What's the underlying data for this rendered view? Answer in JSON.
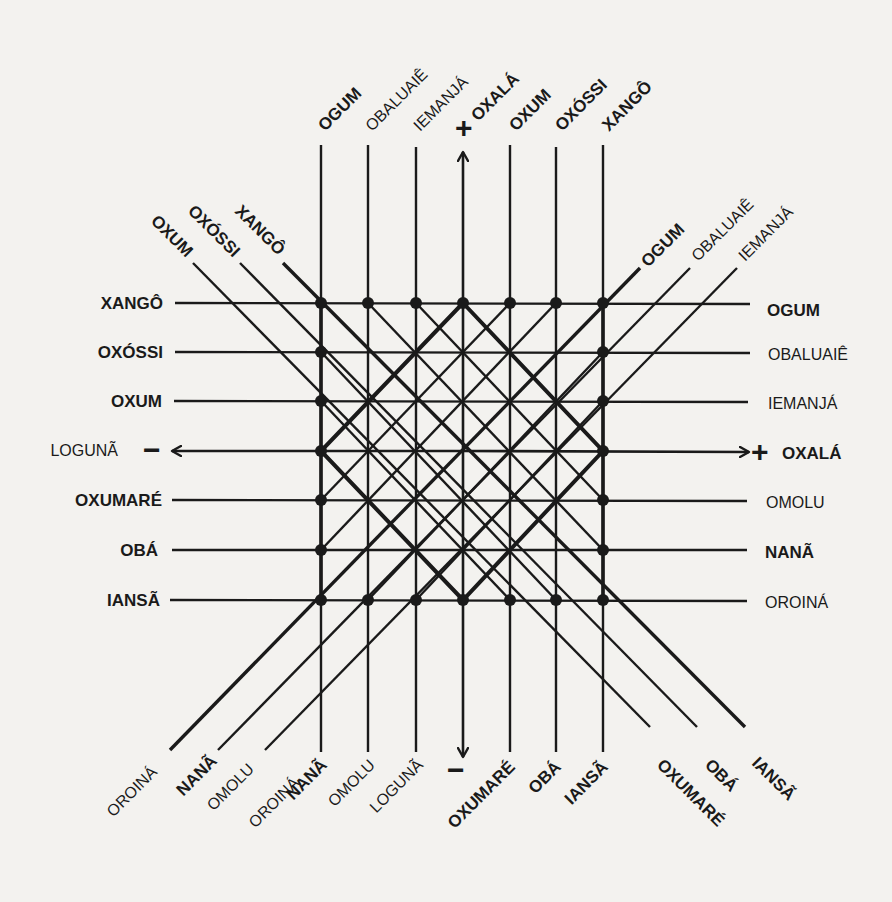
{
  "diagram": {
    "title": "",
    "ink_color": "#1a1a1a",
    "paper_color": "#f3f2ef",
    "grid": {
      "x": [
        321,
        368,
        416,
        463,
        510,
        556,
        603
      ],
      "y": [
        303,
        352,
        401,
        451,
        500,
        550,
        600
      ]
    },
    "top_labels": [
      {
        "text": "OGUM",
        "bold": true
      },
      {
        "text": "OBALUAIÊ",
        "bold": false
      },
      {
        "text": "IEMANJÁ",
        "bold": false
      },
      {
        "text": "OXALÁ",
        "bold": true,
        "sign": "+"
      },
      {
        "text": "OXUM",
        "bold": true
      },
      {
        "text": "OXÓSSI",
        "bold": true
      },
      {
        "text": "XANGÔ",
        "bold": true
      }
    ],
    "bottom_labels": [
      {
        "text": "NANÃ",
        "bold": true
      },
      {
        "text": "OMOLU",
        "bold": false
      },
      {
        "text": "LOGUNÃ",
        "bold": false
      },
      {
        "text": "",
        "bold": false,
        "sign": "−"
      },
      {
        "text": "OXUMARÉ",
        "bold": true
      },
      {
        "text": "OBÁ",
        "bold": true
      },
      {
        "text": "IANSÃ",
        "bold": true
      }
    ],
    "left_labels": [
      {
        "text": "XANGÔ",
        "bold": true
      },
      {
        "text": "OXÓSSI",
        "bold": true
      },
      {
        "text": "OXUM",
        "bold": true
      },
      {
        "text": "LOGUNÃ",
        "bold": false,
        "sign": "−"
      },
      {
        "text": "OXUMARÉ",
        "bold": true
      },
      {
        "text": "OBÁ",
        "bold": true
      },
      {
        "text": "IANSÃ",
        "bold": true
      }
    ],
    "right_labels": [
      {
        "text": "OGUM",
        "bold": true
      },
      {
        "text": "OBALUAIÊ",
        "bold": false
      },
      {
        "text": "IEMANJÁ",
        "bold": false
      },
      {
        "text": "OXALÁ",
        "bold": true,
        "sign": "+"
      },
      {
        "text": "OMOLU",
        "bold": false
      },
      {
        "text": "NANÃ",
        "bold": true
      },
      {
        "text": "OROINÁ",
        "bold": false
      }
    ],
    "diag_top_left_labels": [
      {
        "text": "OXUM",
        "bold": true
      },
      {
        "text": "OXÓSSI",
        "bold": true
      },
      {
        "text": "XANGÔ",
        "bold": true
      }
    ],
    "diag_top_right_labels": [
      {
        "text": "OGUM",
        "bold": true
      },
      {
        "text": "OBALUAIÊ",
        "bold": false
      },
      {
        "text": "IEMANJÁ",
        "bold": false
      }
    ],
    "diag_bottom_left_labels": [
      {
        "text": "OROINÁ",
        "bold": false
      },
      {
        "text": "NANÃ",
        "bold": true
      },
      {
        "text": "OMOLU",
        "bold": false
      },
      {
        "text": "OROINÁ",
        "bold": false
      }
    ],
    "diag_bottom_right_labels": [
      {
        "text": "OXUMARÉ",
        "bold": true
      },
      {
        "text": "OBÁ",
        "bold": true
      },
      {
        "text": "IANSÃ",
        "bold": true
      }
    ],
    "axis_signs": {
      "top_plus": "+",
      "bottom_minus": "−",
      "left_minus": "−",
      "right_plus": "+"
    }
  }
}
